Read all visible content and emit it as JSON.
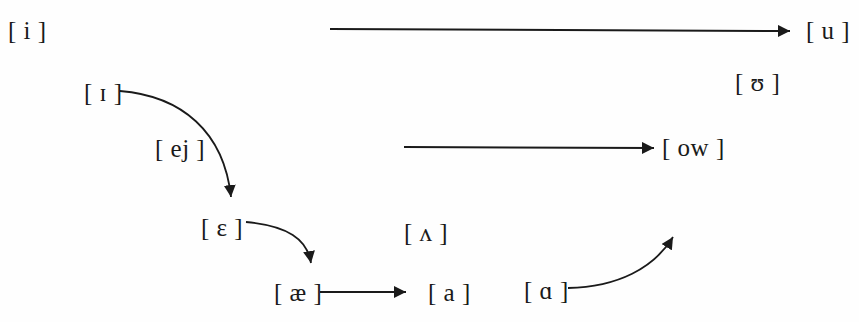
{
  "figure": {
    "kind": "vowel-shift-diagram",
    "background_color": "#fefefe",
    "ink_color": "#1a1a1a",
    "width": 859,
    "height": 322
  },
  "vowels": [
    {
      "id": "i",
      "text": "[ i ]",
      "x": 8,
      "y": 18
    },
    {
      "id": "u",
      "text": "[ u ]",
      "x": 806,
      "y": 18
    },
    {
      "id": "hU",
      "text": "[ ʊ ]",
      "x": 735,
      "y": 70
    },
    {
      "id": "sI",
      "text": "[ ɪ ]",
      "x": 84,
      "y": 80
    },
    {
      "id": "ow",
      "text": "[ ow ]",
      "x": 662,
      "y": 135
    },
    {
      "id": "eps",
      "text": "[ ɛ ]",
      "x": 201,
      "y": 215
    },
    {
      "id": "wedge",
      "text": "[ ʌ ]",
      "x": 404,
      "y": 220
    },
    {
      "id": "ae",
      "text": "[ æ ]",
      "x": 274,
      "y": 280
    },
    {
      "id": "a",
      "text": "[ a ]",
      "x": 428,
      "y": 280
    },
    {
      "id": "script_a",
      "text": "[ ɑ ]",
      "x": 524,
      "y": 278
    }
  ],
  "shift_labels": [
    {
      "id": "ej",
      "text": "[ ej ]",
      "x": 155,
      "y": 136
    }
  ],
  "arrows": [
    {
      "id": "u-to-front",
      "from": "u",
      "to": "i",
      "style": "straight",
      "direction": "left",
      "path": "M 790 31 L 330 29"
    },
    {
      "id": "ow-to-front",
      "from": "ow",
      "to": "mid",
      "style": "straight",
      "direction": "left",
      "path": "M 654 148 L 404 147"
    },
    {
      "id": "smallcap-i-to-epsilon",
      "from": "sI",
      "to": "eps",
      "style": "curved",
      "direction": "down",
      "path": "M 120 91 C 180 96 222 130 230 198"
    },
    {
      "id": "epsilon-to-ae",
      "from": "eps",
      "to": "ae",
      "style": "curved",
      "direction": "down",
      "path": "M 246 222 C 286 226 306 238 311 264"
    },
    {
      "id": "ae-to-a",
      "from": "ae",
      "to": "a",
      "style": "straight",
      "direction": "right",
      "path": "M 320 292 L 406 292"
    },
    {
      "id": "script-a-to-wedge",
      "from": "script_a",
      "to": "raised",
      "style": "curved",
      "direction": "up-right",
      "path": "M 568 288 C 616 287 652 268 673 238"
    }
  ]
}
